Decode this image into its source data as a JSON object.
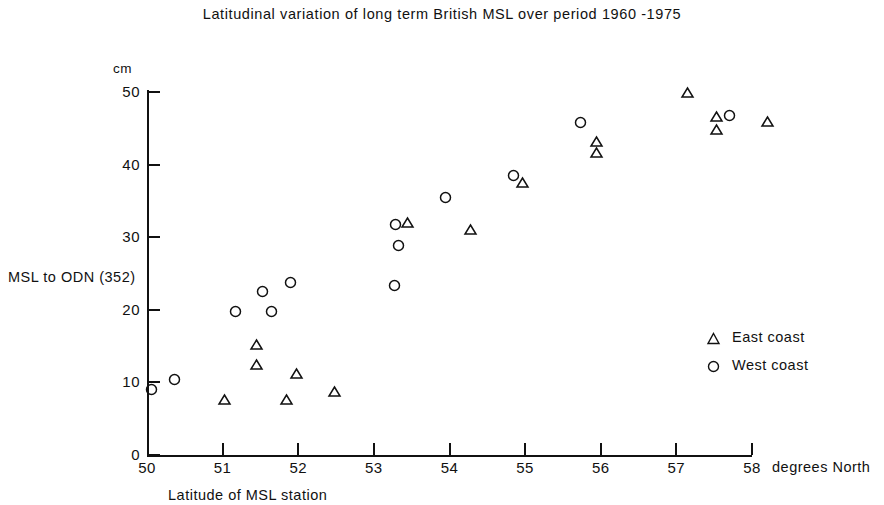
{
  "chart_data": {
    "type": "scatter",
    "title": "Latitudinal variation of long term British MSL over period 1960 -1975",
    "xlabel": "Latitude of MSL station",
    "xunit": "degrees  North",
    "ylabel": "MSL to ODN (352)",
    "yunit": "cm",
    "xlim": [
      50,
      58
    ],
    "ylim": [
      0,
      50
    ],
    "xticks": [
      50,
      51,
      52,
      53,
      54,
      55,
      56,
      57,
      58
    ],
    "xtick_labels": [
      "50",
      "51",
      "52",
      "53",
      "54",
      "55",
      "56",
      "57",
      "58"
    ],
    "yticks": [
      0,
      10,
      20,
      30,
      40,
      50
    ],
    "ytick_labels": [
      "0",
      "10",
      "20",
      "30",
      "40",
      "50"
    ],
    "grid": false,
    "legend_position": "right-middle",
    "series": [
      {
        "name": "East coast",
        "marker": "triangle",
        "color": "#111111",
        "points": [
          {
            "x": 51.02,
            "y": 7.6
          },
          {
            "x": 51.45,
            "y": 15.2
          },
          {
            "x": 51.45,
            "y": 12.5
          },
          {
            "x": 51.85,
            "y": 7.6
          },
          {
            "x": 51.98,
            "y": 11.2
          },
          {
            "x": 52.48,
            "y": 8.7
          },
          {
            "x": 53.45,
            "y": 32.0
          },
          {
            "x": 54.28,
            "y": 31.0
          },
          {
            "x": 54.96,
            "y": 37.6
          },
          {
            "x": 55.95,
            "y": 43.2
          },
          {
            "x": 55.95,
            "y": 41.7
          },
          {
            "x": 57.15,
            "y": 49.9
          },
          {
            "x": 57.53,
            "y": 46.6
          },
          {
            "x": 57.53,
            "y": 44.9
          },
          {
            "x": 58.2,
            "y": 45.9
          }
        ]
      },
      {
        "name": "West coast",
        "marker": "circle",
        "color": "#111111",
        "points": [
          {
            "x": 50.06,
            "y": 9.0
          },
          {
            "x": 50.37,
            "y": 10.4
          },
          {
            "x": 51.17,
            "y": 19.7
          },
          {
            "x": 51.53,
            "y": 22.5
          },
          {
            "x": 51.9,
            "y": 23.7
          },
          {
            "x": 51.65,
            "y": 19.7
          },
          {
            "x": 53.27,
            "y": 23.3
          },
          {
            "x": 53.28,
            "y": 31.8
          },
          {
            "x": 53.32,
            "y": 28.8
          },
          {
            "x": 53.95,
            "y": 35.5
          },
          {
            "x": 54.85,
            "y": 38.5
          },
          {
            "x": 55.73,
            "y": 45.8
          },
          {
            "x": 57.7,
            "y": 46.8
          }
        ]
      }
    ]
  },
  "legend": {
    "entries": [
      {
        "label": "East coast",
        "marker": "triangle"
      },
      {
        "label": "West coast",
        "marker": "circle"
      }
    ]
  }
}
